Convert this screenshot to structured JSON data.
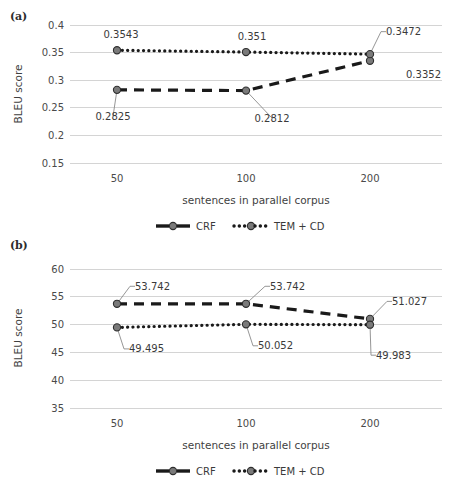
{
  "figure": {
    "panels": [
      {
        "tag": "(a)",
        "name": "panel-a",
        "xlabel": "sentences in parallel corpus",
        "ylabel": "BLEU score",
        "categories": [
          "50",
          "100",
          "200"
        ],
        "yticks": [
          "0.4",
          "0.35",
          "0.3",
          "0.25",
          "0.2",
          "0.15"
        ],
        "ylim": [
          0.15,
          0.4
        ],
        "legend": [
          {
            "label": "CRF",
            "style": "dashed"
          },
          {
            "label": "TEM + CD",
            "style": "dotted"
          }
        ],
        "series": [
          {
            "name": "CRF",
            "style": "dashed",
            "values": [
              0.2825,
              0.2812,
              0.3352
            ],
            "labels": [
              "0.2825",
              "0.2812",
              "0.3352"
            ]
          },
          {
            "name": "TEM + CD",
            "style": "dotted",
            "values": [
              0.3543,
              0.351,
              0.3472
            ],
            "labels": [
              "0.3543",
              "0.351",
              "0.3472"
            ]
          }
        ]
      },
      {
        "tag": "(b)",
        "name": "panel-b",
        "xlabel": "sentences in parallel corpus",
        "ylabel": "BLEU score",
        "categories": [
          "50",
          "100",
          "200"
        ],
        "yticks": [
          "60",
          "55",
          "50",
          "45",
          "40",
          "35"
        ],
        "ylim": [
          35,
          60
        ],
        "legend": [
          {
            "label": "CRF",
            "style": "dashed"
          },
          {
            "label": "TEM + CD",
            "style": "dotted"
          }
        ],
        "series": [
          {
            "name": "CRF",
            "style": "dashed",
            "values": [
              53.742,
              53.742,
              51.027
            ],
            "labels": [
              "53.742",
              "53.742",
              "51.027"
            ]
          },
          {
            "name": "TEM + CD",
            "style": "dotted",
            "values": [
              49.495,
              50.052,
              49.983
            ],
            "labels": [
              "49.495",
              "50.052",
              "49.983"
            ]
          }
        ]
      }
    ]
  },
  "chart_data": [
    {
      "type": "line",
      "title": "(a)",
      "xlabel": "sentences in parallel corpus",
      "ylabel": "BLEU score",
      "categories": [
        50,
        100,
        200
      ],
      "ylim": [
        0.15,
        0.4
      ],
      "yticks": [
        0.15,
        0.2,
        0.25,
        0.3,
        0.35,
        0.4
      ],
      "grid": "horizontal",
      "legend_position": "bottom",
      "series": [
        {
          "name": "CRF",
          "values": [
            0.2825,
            0.2812,
            0.3352
          ]
        },
        {
          "name": "TEM + CD",
          "values": [
            0.3543,
            0.351,
            0.3472
          ]
        }
      ]
    },
    {
      "type": "line",
      "title": "(b)",
      "xlabel": "sentences in parallel corpus",
      "ylabel": "BLEU score",
      "categories": [
        50,
        100,
        200
      ],
      "ylim": [
        35,
        60
      ],
      "yticks": [
        35,
        40,
        45,
        50,
        55,
        60
      ],
      "grid": "horizontal",
      "legend_position": "bottom",
      "series": [
        {
          "name": "CRF",
          "values": [
            53.742,
            53.742,
            51.027
          ]
        },
        {
          "name": "TEM + CD",
          "values": [
            49.495,
            50.052,
            49.983
          ]
        }
      ]
    }
  ]
}
